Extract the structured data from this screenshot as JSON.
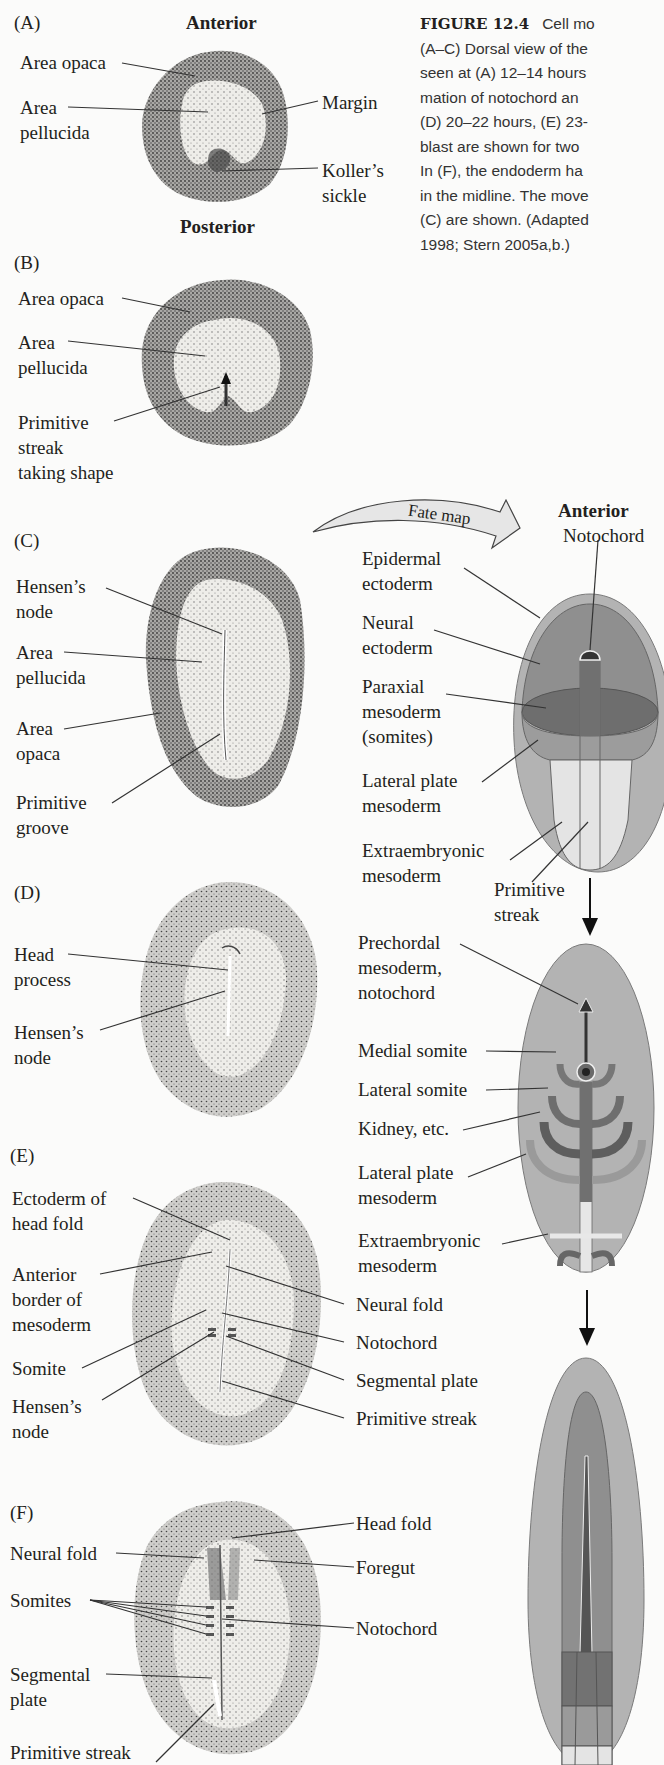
{
  "caption": {
    "figure_label": "FIGURE 12.4",
    "line1": "Cell mo",
    "lines": [
      "(A–C) Dorsal view of the",
      "seen at (A) 12–14 hours",
      "mation of notochord an",
      "(D) 20–22 hours, (E) 23-",
      "blast are shown for two",
      "In (F), the endoderm ha",
      "in the midline. The move",
      "(C) are shown. (Adapted",
      "1998; Stern 2005a,b.)"
    ]
  },
  "panels": {
    "A": {
      "tag": "(A)",
      "top": "Anterior",
      "bottom": "Posterior",
      "labels": [
        "Area opaca",
        "Area\npellucida",
        "Margin",
        "Koller’s\nsickle"
      ]
    },
    "B": {
      "tag": "(B)",
      "labels": [
        "Area opaca",
        "Area\npellucida",
        "Primitive\nstreak\ntaking shape"
      ]
    },
    "C": {
      "tag": "(C)",
      "labels": [
        "Hensen’s\nnode",
        "Area\npellucida",
        "Area\nopaca",
        "Primitive\ngroove"
      ]
    },
    "D": {
      "tag": "(D)",
      "labels": [
        "Head\nprocess",
        "Hensen’s\nnode"
      ]
    },
    "E": {
      "tag": "(E)",
      "labels_left": [
        "Ectoderm of\nhead fold",
        "Anterior\nborder of\nmesoderm",
        "Somite",
        "Hensen’s\nnode"
      ],
      "labels_right": [
        "Neural fold",
        "Notochord",
        "Segmental plate",
        "Primitive streak"
      ]
    },
    "F": {
      "tag": "(F)",
      "labels_left": [
        "Neural fold",
        "Somites",
        "Segmental\nplate",
        "Primitive streak"
      ],
      "labels_right": [
        "Head fold",
        "Foregut",
        "Notochord"
      ]
    }
  },
  "fate_map": {
    "arrow_label": "Fate map",
    "anterior": "Anterior",
    "notochord": "Notochord",
    "labels": [
      "Epidermal\nectoderm",
      "Neural\nectoderm",
      "Paraxial\nmesoderm\n(somites)",
      "Lateral plate\nmesoderm",
      "Extraembryonic\nmesoderm",
      "Primitive\nstreak"
    ],
    "movement_labels": [
      "Prechordal\nmesoderm,\nnotochord",
      "Medial somite",
      "Lateral somite",
      "Kidney, etc.",
      "Lateral plate\nmesoderm",
      "Extraembryonic\nmesoderm"
    ]
  },
  "colors": {
    "outer": "#b3b3b3",
    "neural": "#8f8f8f",
    "paraxial": "#6e6e6e",
    "lateral": "#9c9c9c",
    "extra": "#e4e4e4",
    "dark": "#4d4d4d",
    "stipple_light": "#ecebe8",
    "stipple_dark": "#6a6a6a"
  }
}
